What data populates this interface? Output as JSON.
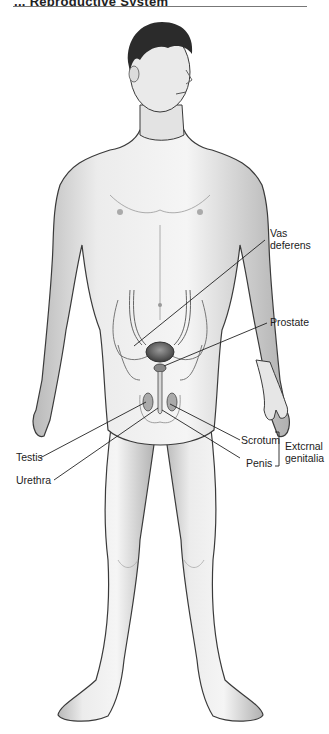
{
  "header": {
    "cut_text": "... Reproductive System",
    "rule": true
  },
  "figure": {
    "labels": {
      "vas_deferens_1": "Vas",
      "vas_deferens_2": "deferens",
      "prostate": "Prostate",
      "scrotum": "Scrotum",
      "penis": "Penis",
      "testis": "Testis",
      "urethra": "Urethra",
      "external_1": "Extcrnal",
      "external_2": "genitalia"
    },
    "colors": {
      "skin_light": "#f2f2f2",
      "skin_shade": "#bdbdbd",
      "outline": "#3a3a3a",
      "hair": "#2b2b2b",
      "leader": "#222222"
    }
  }
}
